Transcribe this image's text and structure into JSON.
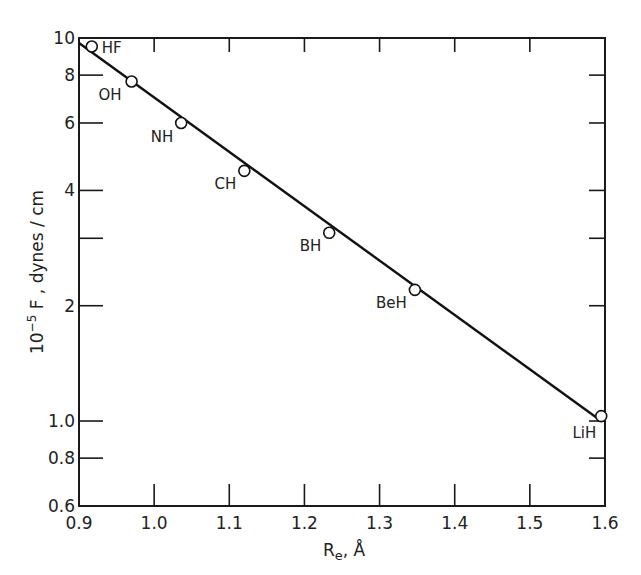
{
  "chart_data": {
    "type": "scatter",
    "title": "",
    "xlabel": "Re, Å",
    "ylabel": "10⁻⁵ F ,  dynes / cm",
    "x_scale": "linear",
    "y_scale": "log",
    "xlim": [
      0.9,
      1.6
    ],
    "ylim": [
      0.6,
      10
    ],
    "x_ticks": [
      0.9,
      1.0,
      1.1,
      1.2,
      1.3,
      1.4,
      1.5,
      1.6
    ],
    "x_tick_labels": [
      "0.9",
      "1.0",
      "1.1",
      "1.2",
      "1.3",
      "1.4",
      "1.5",
      "1.6"
    ],
    "y_ticks": [
      0.6,
      0.8,
      1.0,
      2,
      3,
      4,
      6,
      8,
      10
    ],
    "y_tick_labels": [
      "0.6",
      "0.8",
      "1.0",
      "2",
      "",
      "4",
      "6",
      "8",
      "10"
    ],
    "grid": false,
    "legend": null,
    "series": [
      {
        "name": "Diatomic hydrides",
        "marker": "open-circle",
        "points": [
          {
            "label": "HF",
            "x": 0.917,
            "y": 9.5
          },
          {
            "label": "OH",
            "x": 0.97,
            "y": 7.7
          },
          {
            "label": "NH",
            "x": 1.036,
            "y": 6.0
          },
          {
            "label": "CH",
            "x": 1.12,
            "y": 4.5
          },
          {
            "label": "BH",
            "x": 1.233,
            "y": 3.1
          },
          {
            "label": "BeH",
            "x": 1.347,
            "y": 2.2
          },
          {
            "label": "LiH",
            "x": 1.595,
            "y": 1.03
          }
        ]
      },
      {
        "name": "Fit line",
        "type": "line",
        "x": [
          0.9,
          1.595
        ],
        "y": [
          9.7,
          1.0
        ]
      }
    ]
  },
  "axis": {
    "x_label_main": "R",
    "x_label_sub": "e",
    "x_label_unit": ", Å",
    "y_label_prefix": "10",
    "y_label_exp": "−5",
    "y_label_rest": " F ,   dynes / cm"
  }
}
